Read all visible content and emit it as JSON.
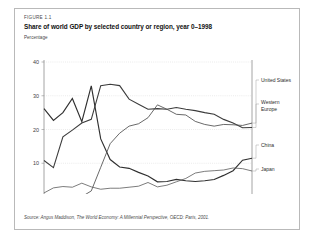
{
  "figure": {
    "label": "FIGURE 1.1",
    "title": "Share of world GDP by selected country or region, year 0–1998",
    "unit_label": "Percentage",
    "source": "Source: Angus Maddison, The World Economy: A Millennial Perspective, OECD: Paris, 2001."
  },
  "colors": {
    "frame_border": "#b9b9b9",
    "grid": "#d6d6d6",
    "axis": "#8d8d8d",
    "series_china": "#303030",
    "series_western_europe": "#3c3c3c",
    "series_united_states": "#4e4e4e",
    "series_japan": "#5a5a5a",
    "page_background": "#ffffff"
  },
  "chart_data": {
    "type": "line",
    "title": "Share of world GDP by selected country or region, year 0–1998",
    "xlabel": "",
    "ylabel": "Percentage",
    "ylim": [
      0,
      40
    ],
    "yticks": [
      0,
      10,
      20,
      30,
      40
    ],
    "grid": true,
    "legend_position": "right",
    "x": [
      "0",
      "1000",
      "1500",
      "1600",
      "1700",
      "1820",
      "1870",
      "1900",
      "1913",
      "1920",
      "1930",
      "1940",
      "1950",
      "1955",
      "1960",
      "1965",
      "1970",
      "1975",
      "1980",
      "1985",
      "1990",
      "1995",
      "1998"
    ],
    "xtick_labels": [
      "0",
      "1000",
      "1500",
      "1600",
      "1700",
      "1820",
      "1870",
      "1900",
      "1913",
      "1920",
      "1930",
      "1940",
      "1950",
      "1955",
      "1960",
      "1965",
      "1970",
      "1975",
      "1980",
      "1985",
      "1990",
      "1995",
      "1998"
    ],
    "xtick_last_label": "1998",
    "series": [
      {
        "name": "China",
        "values": [
          26.2,
          22.7,
          25.0,
          29.2,
          22.3,
          32.9,
          17.2,
          11.1,
          8.9,
          8.5,
          7.3,
          6.2,
          4.5,
          4.6,
          5.2,
          4.8,
          4.6,
          4.8,
          5.2,
          6.4,
          7.8,
          10.9,
          11.5
        ]
      },
      {
        "name": "Western Europe",
        "values": [
          10.8,
          8.7,
          17.8,
          19.8,
          21.9,
          23.0,
          33.0,
          33.4,
          33.0,
          29.0,
          27.5,
          26.0,
          26.2,
          26.0,
          26.5,
          26.0,
          25.6,
          25.0,
          24.5,
          23.0,
          21.9,
          20.5,
          20.6
        ]
      },
      {
        "name": "United States",
        "values": [
          0.3,
          0.3,
          0.3,
          0.2,
          0.1,
          1.8,
          8.8,
          15.8,
          18.9,
          21.0,
          21.7,
          23.5,
          27.3,
          26.0,
          24.5,
          24.3,
          22.4,
          21.5,
          21.0,
          21.5,
          21.4,
          21.2,
          21.9
        ]
      },
      {
        "name": "Japan",
        "values": [
          1.2,
          2.7,
          3.1,
          2.9,
          4.1,
          3.0,
          2.3,
          2.6,
          2.6,
          2.9,
          3.2,
          4.3,
          3.0,
          3.5,
          4.5,
          5.5,
          7.1,
          7.6,
          7.8,
          8.0,
          8.6,
          8.4,
          7.7
        ]
      }
    ],
    "legend_entries": [
      {
        "label": "United States",
        "value_1998": 21.9
      },
      {
        "label": "Western Europe",
        "value_1998": 20.6
      },
      {
        "label": "China",
        "value_1998": 11.5
      },
      {
        "label": "Japan",
        "value_1998": 7.7
      }
    ]
  }
}
